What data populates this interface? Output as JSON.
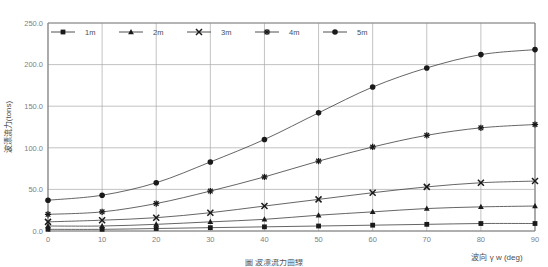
{
  "chart_data": {
    "type": "line",
    "title": "",
    "xlabel": "波向 γ w  (deg)",
    "ylabel": "波漂流力(tons)",
    "x": [
      0,
      10,
      20,
      30,
      40,
      50,
      60,
      70,
      80,
      90
    ],
    "xticklabels": [
      "0",
      "10",
      "20",
      "30",
      "40",
      "50",
      "60",
      "70",
      "80",
      "90"
    ],
    "yticklabels": [
      "0.0",
      "50.0",
      "100.0",
      "150.0",
      "200.0",
      "250.0"
    ],
    "yticks": [
      0,
      50,
      100,
      150,
      200,
      250
    ],
    "xlim": [
      0,
      90
    ],
    "ylim": [
      0,
      250
    ],
    "grid": "both",
    "legend_position": "top-inside",
    "series": [
      {
        "name": "1m",
        "marker": "square",
        "values": [
          2,
          2,
          3,
          4,
          5,
          6,
          7,
          8,
          9,
          9
        ]
      },
      {
        "name": "2m",
        "marker": "triangle",
        "values": [
          6,
          6,
          8,
          11,
          14,
          19,
          23,
          27,
          29,
          30
        ]
      },
      {
        "name": "3m",
        "marker": "cross",
        "values": [
          11,
          13,
          16,
          22,
          30,
          38,
          46,
          53,
          58,
          60
        ]
      },
      {
        "name": "4m",
        "marker": "asterisk",
        "values": [
          20,
          23,
          33,
          48,
          65,
          84,
          101,
          115,
          124,
          128
        ]
      },
      {
        "name": "5m",
        "marker": "circle",
        "values": [
          37,
          43,
          58,
          83,
          110,
          142,
          173,
          196,
          212,
          218
        ]
      }
    ]
  },
  "axis_label_x": "波向 γ w  (deg)",
  "axis_label_y": "波漂流力(tons)",
  "caption": "圖 波漂流力曲線",
  "colors": {
    "series_line": "#3d3d3d",
    "marker": "#1a1a1a",
    "grid": "#a9a9a9",
    "axis": "#7f7f7f",
    "tick_text": "#808080",
    "label_text": "#4d4d4d"
  },
  "legend": {
    "items": [
      "1m",
      "2m",
      "3m",
      "4m",
      "5m"
    ]
  }
}
